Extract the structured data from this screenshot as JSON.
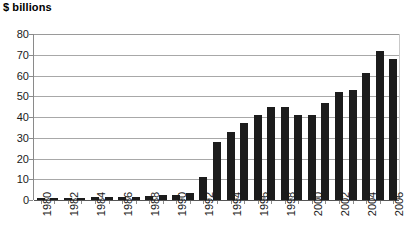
{
  "chart_data": {
    "type": "bar",
    "title": "$ billions",
    "xlabel": "",
    "ylabel": "$ billions",
    "ylim": [
      0,
      80
    ],
    "ytick_values": [
      0,
      10,
      20,
      30,
      40,
      50,
      60,
      70,
      80
    ],
    "ytick_labels": [
      "0",
      "10",
      "20",
      "30",
      "40",
      "50",
      "60",
      "70",
      "80"
    ],
    "grid": true,
    "legend": "none",
    "bar_color": "#1c1c1c",
    "categories": [
      "1980",
      "1981",
      "1982",
      "1983",
      "1984",
      "1985",
      "1986",
      "1987",
      "1988",
      "1989",
      "1990",
      "1991",
      "1992",
      "1993",
      "1994",
      "1995",
      "1996",
      "1997",
      "1998",
      "1999",
      "2000",
      "2001",
      "2002",
      "2003",
      "2004",
      "2005",
      "2006"
    ],
    "xtick_labels_shown": [
      "1980",
      "",
      "1982",
      "",
      "1984",
      "",
      "1986",
      "",
      "1988",
      "",
      "1990",
      "",
      "1992",
      "",
      "1994",
      "",
      "1996",
      "",
      "1998",
      "",
      "2000",
      "",
      "2002",
      "",
      "2004",
      "",
      "2006"
    ],
    "values": [
      0.5,
      0.7,
      0.8,
      1.0,
      1.3,
      1.4,
      1.5,
      1.6,
      2.0,
      2.2,
      2.5,
      3.5,
      11.0,
      28.0,
      33.0,
      37.0,
      41.0,
      45.0,
      45.0,
      41.0,
      41.0,
      47.0,
      52.0,
      53.0,
      61.0,
      72.0,
      68.0
    ]
  }
}
